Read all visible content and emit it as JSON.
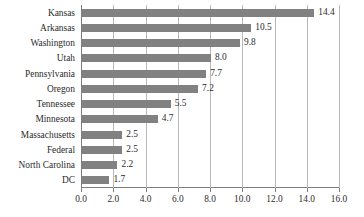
{
  "chart_data": {
    "type": "bar",
    "orientation": "horizontal",
    "title": "",
    "xlabel": "",
    "ylabel": "",
    "categories": [
      "Kansas",
      "Arkansas",
      "Washington",
      "Utah",
      "Pennsylvania",
      "Oregon",
      "Tennessee",
      "Minnesota",
      "Massachusetts",
      "Federal",
      "North Carolina",
      "DC"
    ],
    "values": [
      14.4,
      10.5,
      9.8,
      8.0,
      7.7,
      7.2,
      5.5,
      4.7,
      2.5,
      2.5,
      2.2,
      1.7
    ],
    "value_labels": [
      "14.4",
      "10.5",
      "9.8",
      "8.0",
      "7.7",
      "7.2",
      "5.5",
      "4.7",
      "2.5",
      "2.5",
      "2.2",
      "1.7"
    ],
    "xlim": [
      0.0,
      16.0
    ],
    "xticks": [
      0.0,
      2.0,
      4.0,
      6.0,
      8.0,
      10.0,
      12.0,
      14.0,
      16.0
    ],
    "xtick_labels": [
      "0.0",
      "2.0",
      "4.0",
      "6.0",
      "8.0",
      "10.0",
      "12.0",
      "14.0",
      "16.0"
    ],
    "grid": "vertical",
    "legend": "none",
    "bar_color": "#818181",
    "axis_color": "#7d7d7d",
    "gridline_color": "#b9b9b9",
    "background_color": "#ffffff",
    "text_color": "#2b2b2b"
  }
}
